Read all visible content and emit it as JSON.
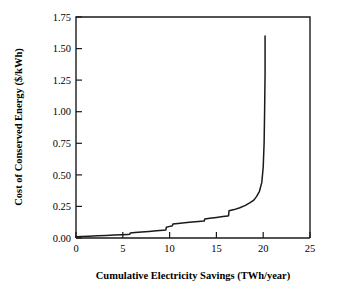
{
  "figure": {
    "background_color": "#ffffff",
    "line_color": "#1a1a1a"
  },
  "chart_data": {
    "type": "line",
    "title": "",
    "xlabel": "Cumulative Electricity Savings (TWh/year)",
    "ylabel": "Cost of Conserved Energy ($/kWh)",
    "xlim": [
      0,
      25
    ],
    "ylim": [
      0,
      1.75
    ],
    "xticks": [
      0,
      5,
      10,
      15,
      20,
      25
    ],
    "yticks": [
      0.0,
      0.25,
      0.5,
      0.75,
      1.0,
      1.25,
      1.5,
      1.75
    ],
    "xtick_labels": [
      "0",
      "5",
      "10",
      "15",
      "20",
      "25"
    ],
    "ytick_labels": [
      "0.00",
      "0.25",
      "0.50",
      "0.75",
      "1.00",
      "1.25",
      "1.50",
      "1.75"
    ],
    "grid": false,
    "legend": false,
    "series": [
      {
        "name": "Conservation supply curve",
        "color": "#1a1a1a",
        "x": [
          0.0,
          0.6,
          1.4,
          2.3,
          3.2,
          4.1,
          4.9,
          5.5,
          5.75,
          5.8,
          6.3,
          7.0,
          7.8,
          8.6,
          9.3,
          9.6,
          9.65,
          9.9,
          10.2,
          10.3,
          10.35,
          10.9,
          11.6,
          12.4,
          13.1,
          13.6,
          13.7,
          13.75,
          14.3,
          15.0,
          15.7,
          16.2,
          16.3,
          16.35,
          16.9,
          17.5,
          18.1,
          18.6,
          19.0,
          19.3,
          19.6,
          19.85,
          20.0,
          20.1,
          20.15,
          20.2,
          20.2
        ],
        "y": [
          0.01,
          0.012,
          0.014,
          0.017,
          0.02,
          0.023,
          0.026,
          0.028,
          0.029,
          0.04,
          0.043,
          0.047,
          0.052,
          0.057,
          0.062,
          0.064,
          0.085,
          0.09,
          0.095,
          0.097,
          0.11,
          0.115,
          0.12,
          0.126,
          0.131,
          0.134,
          0.135,
          0.15,
          0.156,
          0.163,
          0.17,
          0.175,
          0.176,
          0.215,
          0.225,
          0.24,
          0.258,
          0.28,
          0.3,
          0.33,
          0.37,
          0.44,
          0.56,
          0.76,
          1.0,
          1.3,
          1.6
        ]
      }
    ]
  },
  "axes": {
    "y_axis_title": "Cost of Conserved Energy ($/kWh)",
    "x_axis_title": "Cumulative Electricity Savings (TWh/year)"
  }
}
